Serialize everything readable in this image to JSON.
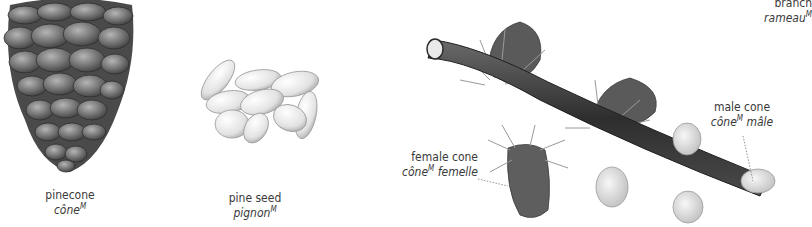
{
  "items": [
    {
      "id": "pinecone",
      "en": "pinecone",
      "fr": "cône",
      "gender": "M",
      "fr_suffix": ""
    },
    {
      "id": "pine-seed",
      "en": "pine seed",
      "fr": "pignon",
      "gender": "M",
      "fr_suffix": ""
    },
    {
      "id": "branch",
      "en": "branch",
      "fr": "rameau",
      "gender": "M",
      "fr_suffix": ""
    },
    {
      "id": "female-cone",
      "en": "female cone",
      "fr": "cône",
      "gender": "M",
      "fr_suffix": " femelle"
    },
    {
      "id": "male-cone",
      "en": "male cone",
      "fr": "cône",
      "gender": "M",
      "fr_suffix": " mâle"
    }
  ],
  "colors": {
    "text": "#3a3a3a",
    "leader_line": "#777777",
    "cone_dark": "#5e5e5e",
    "seed_light": "#e6e6e6",
    "branch_dark": "#3c3c3c"
  }
}
